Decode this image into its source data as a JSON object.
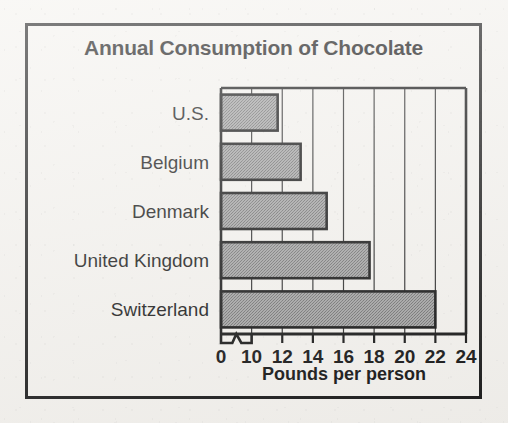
{
  "figure": {
    "title": "Annual Consumption of Chocolate",
    "background_color": "#f4f2ee",
    "frame_color": "#1b1b1b"
  },
  "chart_data": {
    "type": "bar",
    "orientation": "horizontal",
    "title": "Annual Consumption of Chocolate",
    "xlabel": "Pounds per person",
    "ylabel": "",
    "categories": [
      "U.S.",
      "Belgium",
      "Denmark",
      "United Kingdom",
      "Switzerland"
    ],
    "values": [
      11.7,
      13.2,
      14.9,
      17.7,
      22.0
    ],
    "xlim": [
      0,
      24
    ],
    "xticks": [
      0,
      10,
      12,
      14,
      16,
      18,
      20,
      22,
      24
    ],
    "xtick_labels": [
      "0",
      "10",
      "12",
      "14",
      "16",
      "18",
      "20",
      "22",
      "24"
    ],
    "axis_break": {
      "present": true,
      "between": [
        0,
        10
      ],
      "symbol": "zigzag"
    },
    "grid": true,
    "grid_axis": "x",
    "legend": null,
    "bar_fill_color": "#9a9a9a",
    "bar_edge_color": "#121212"
  },
  "axis": {
    "x_title": "Pounds per person",
    "ticks": [
      {
        "label": "0",
        "value": 0
      },
      {
        "label": "10",
        "value": 10
      },
      {
        "label": "12",
        "value": 12
      },
      {
        "label": "14",
        "value": 14
      },
      {
        "label": "16",
        "value": 16
      },
      {
        "label": "18",
        "value": 18
      },
      {
        "label": "20",
        "value": 20
      },
      {
        "label": "22",
        "value": 22
      },
      {
        "label": "24",
        "value": 24
      }
    ]
  },
  "bars": [
    {
      "label": "U.S.",
      "value": 11.7
    },
    {
      "label": "Belgium",
      "value": 13.2
    },
    {
      "label": "Denmark",
      "value": 14.9
    },
    {
      "label": "United Kingdom",
      "value": 17.7
    },
    {
      "label": "Switzerland",
      "value": 22.0
    }
  ]
}
